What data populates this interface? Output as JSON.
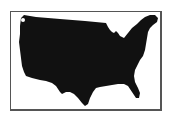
{
  "figure": {
    "fill_color": "#111111",
    "frame_color": "#555555",
    "background": "#ffffff"
  }
}
